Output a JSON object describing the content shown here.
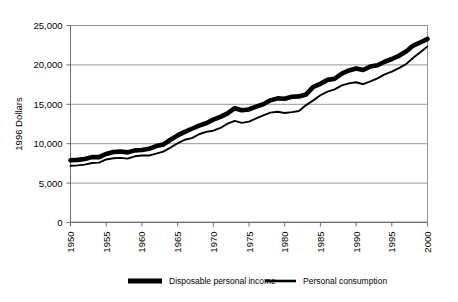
{
  "chart_data": {
    "type": "line",
    "title": "",
    "subtitle": "",
    "xlabel": "",
    "ylabel": "1996 Dollars",
    "xlim": [
      1950,
      2000
    ],
    "ylim": [
      0,
      25000
    ],
    "grid": true,
    "grid_axis": "y",
    "legend_position": "bottom",
    "x_tick_labels": [
      "1950",
      "1955",
      "1960",
      "1965",
      "1970",
      "1975",
      "1980",
      "1985",
      "1990",
      "1995",
      "2000"
    ],
    "x_tick_values": [
      1950,
      1955,
      1960,
      1965,
      1970,
      1975,
      1980,
      1985,
      1990,
      1995,
      2000
    ],
    "y_tick_labels": [
      "0",
      "5,000",
      "10,000",
      "15,000",
      "20,000",
      "25,000"
    ],
    "y_tick_values": [
      0,
      5000,
      10000,
      15000,
      20000,
      25000
    ],
    "x": [
      1950,
      1951,
      1952,
      1953,
      1954,
      1955,
      1956,
      1957,
      1958,
      1959,
      1960,
      1961,
      1962,
      1963,
      1964,
      1965,
      1966,
      1967,
      1968,
      1969,
      1970,
      1971,
      1972,
      1973,
      1974,
      1975,
      1976,
      1977,
      1978,
      1979,
      1980,
      1981,
      1982,
      1983,
      1984,
      1985,
      1986,
      1987,
      1988,
      1989,
      1990,
      1991,
      1992,
      1993,
      1994,
      1995,
      1996,
      1997,
      1998,
      1999,
      2000
    ],
    "series": [
      {
        "name": "Disposable personal income",
        "style": "thick",
        "color": "#000000",
        "values": [
          7900,
          7950,
          8050,
          8300,
          8300,
          8700,
          8950,
          9000,
          8900,
          9150,
          9200,
          9350,
          9700,
          9900,
          10500,
          11050,
          11500,
          11900,
          12300,
          12600,
          13050,
          13400,
          13850,
          14500,
          14250,
          14350,
          14700,
          15000,
          15500,
          15750,
          15700,
          15950,
          16000,
          16250,
          17200,
          17600,
          18100,
          18250,
          18900,
          19300,
          19550,
          19350,
          19800,
          19950,
          20400,
          20750,
          21150,
          21700,
          22450,
          22850,
          23300
        ]
      },
      {
        "name": "Personal consumption",
        "style": "thin",
        "color": "#000000",
        "values": [
          7200,
          7250,
          7350,
          7550,
          7600,
          8000,
          8150,
          8200,
          8100,
          8400,
          8500,
          8500,
          8750,
          9000,
          9500,
          10050,
          10500,
          10700,
          11200,
          11500,
          11650,
          12000,
          12550,
          12900,
          12650,
          12800,
          13200,
          13600,
          13950,
          14050,
          13900,
          14000,
          14150,
          14900,
          15500,
          16150,
          16600,
          16900,
          17400,
          17650,
          17800,
          17550,
          17900,
          18300,
          18800,
          19150,
          19600,
          20100,
          20900,
          21600,
          22350
        ]
      }
    ]
  },
  "axis": {
    "y_title": "1996 Dollars"
  },
  "legend": {
    "items": [
      {
        "label": "Disposable personal income",
        "style": "thick"
      },
      {
        "label": "Personal consumption",
        "style": "thin"
      }
    ]
  }
}
